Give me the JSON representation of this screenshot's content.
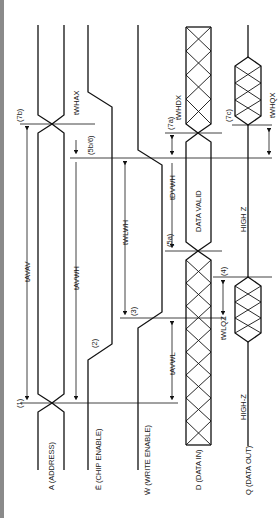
{
  "diagram": {
    "signals": [
      {
        "id": "address",
        "label": "A (ADDRESS)"
      },
      {
        "id": "chip_enable",
        "label": "Ē (CHIP ENABLE)"
      },
      {
        "id": "write_enable",
        "label": "W̄ (WRITE ENABLE)"
      },
      {
        "id": "data_in",
        "label": "D (DATA IN)"
      },
      {
        "id": "data_out",
        "label": "Q (DATA OUT)"
      }
    ],
    "annotations": {
      "data_valid": "DATA VALID",
      "high_z_upper": "HIGH Z",
      "high_z_lower": "HIGH-Z"
    },
    "timing_params": {
      "tavav": "tAVAV",
      "tavwh": "tAVWH",
      "twlwh": "tWLWH",
      "tavwl": "tAVWL",
      "tdvwh": "tDVWH",
      "twhdx": "tWHDX",
      "twhax": "tWHAX",
      "twlqz": "tWLQZ",
      "twhqx": "tWHQX"
    },
    "notes": {
      "n1": "(1)",
      "n2": "(2)",
      "n3": "(3)",
      "n4": "(4)",
      "n5a": "(5a)",
      "n5b6": "(5b/6)",
      "n7a": "(7a)",
      "n7b": "(7b)",
      "n7c": "(7c)"
    }
  }
}
